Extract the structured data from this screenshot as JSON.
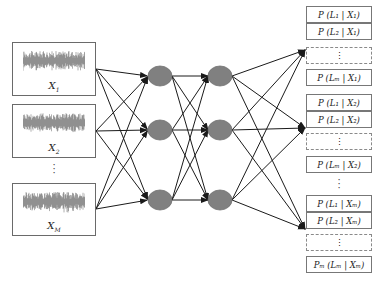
{
  "diagram": {
    "type": "neural-network-classification",
    "colors": {
      "node_fill": "#808080",
      "node_stroke": "#6e6e6e",
      "edge": "#1a1a1a",
      "box_border": "#6a6a6a",
      "dashed_border": "#8a8a8a"
    },
    "inputs": [
      {
        "label": "X",
        "sub": "1",
        "top": 42,
        "height": 54,
        "anchor_y": 69
      },
      {
        "label": "X",
        "sub": "2",
        "top": 104,
        "height": 54,
        "anchor_y": 131
      },
      {
        "label": "X",
        "sub": "M",
        "top": 183,
        "height": 53,
        "anchor_y": 209
      }
    ],
    "input_ellipsis": "⋮",
    "hidden_layers": [
      {
        "x": 160,
        "nodes_y": [
          76,
          130,
          200
        ]
      },
      {
        "x": 220,
        "nodes_y": [
          76,
          130,
          200
        ]
      }
    ],
    "output_groups": [
      {
        "anchor_y": 50,
        "rows": [
          {
            "text": "P (L₁ | X₁)",
            "top": 6
          },
          {
            "text": "P (L₂ | X₁)",
            "top": 23
          },
          {
            "text": "⋮",
            "top": 47,
            "dashed": true
          },
          {
            "text": "P (Lₘ | X₁)",
            "top": 69
          }
        ]
      },
      {
        "anchor_y": 128,
        "rows": [
          {
            "text": "P (L₁ | X₂)",
            "top": 94
          },
          {
            "text": "P (L₂ | X₂)",
            "top": 111
          },
          {
            "text": "⋮",
            "top": 133,
            "dashed": true
          },
          {
            "text": "P (Lₘ | X₂)",
            "top": 156
          }
        ]
      },
      {
        "anchor_y": 229,
        "rows": [
          {
            "text": "P (L₁ | Xₘ)",
            "top": 195
          },
          {
            "text": "P (L₂ | Xₘ)",
            "top": 212
          },
          {
            "text": "⋮",
            "top": 234,
            "dashed": true
          },
          {
            "text": "Pₘ (Lₘ | Xₘ)",
            "top": 256
          }
        ]
      }
    ],
    "output_ellipsis": "⋮"
  }
}
